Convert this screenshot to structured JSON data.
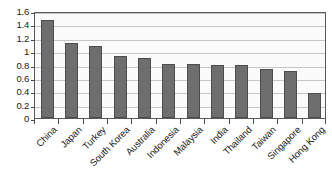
{
  "chart_data": {
    "type": "bar",
    "title": "",
    "xlabel": "",
    "ylabel": "",
    "categories": [
      "China",
      "Japan",
      "Turkey",
      "South Korea",
      "Australia",
      "Indonesia",
      "Malaysia",
      "India",
      "Thailand",
      "Taiwan",
      "Singapore",
      "Hong Kong"
    ],
    "values": [
      1.47,
      1.12,
      1.08,
      0.92,
      0.89,
      0.81,
      0.81,
      0.79,
      0.79,
      0.73,
      0.7,
      0.38
    ],
    "ylim": [
      0,
      1.6
    ],
    "ytick_labels": [
      "0",
      "0.2",
      "0.4",
      "0.6",
      "0.8",
      "1",
      "1.2",
      "1.4",
      "1.6"
    ],
    "ytick_values": [
      0,
      0.2,
      0.4,
      0.6,
      0.8,
      1,
      1.2,
      1.4,
      1.6
    ],
    "grid": true,
    "legend": null,
    "bar_color": "#6e6e6e",
    "bar_border_color": "#4d4d4d",
    "plot_background": "#fbfbfb",
    "gridline_color": "#c6c6c6",
    "axis_color": "#5a5a5a"
  }
}
